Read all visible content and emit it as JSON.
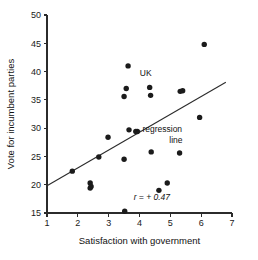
{
  "chart_data": {
    "type": "scatter",
    "title": "",
    "xlabel": "Satisfaction with government",
    "ylabel": "Vote for incumbent parties",
    "xlim": [
      1,
      7
    ],
    "ylim": [
      15,
      50
    ],
    "xticks": [
      1,
      2,
      3,
      4,
      5,
      6,
      7
    ],
    "yticks": [
      15,
      20,
      25,
      30,
      35,
      40,
      45,
      50
    ],
    "xtick_labels": [
      "1",
      "2",
      "3",
      "4",
      "5",
      "6",
      "7"
    ],
    "ytick_labels": [
      "15",
      "20",
      "25",
      "30",
      "35",
      "40",
      "45",
      "50"
    ],
    "grid": false,
    "legend": "none",
    "points": [
      {
        "x": 1.82,
        "y": 22.4
      },
      {
        "x": 2.4,
        "y": 20.3
      },
      {
        "x": 2.4,
        "y": 19.4
      },
      {
        "x": 2.43,
        "y": 19.7
      },
      {
        "x": 2.68,
        "y": 24.9
      },
      {
        "x": 2.98,
        "y": 28.4
      },
      {
        "x": 3.5,
        "y": 35.6
      },
      {
        "x": 3.5,
        "y": 24.5
      },
      {
        "x": 3.52,
        "y": 15.3
      },
      {
        "x": 3.57,
        "y": 37.0
      },
      {
        "x": 3.63,
        "y": 41.0
      },
      {
        "x": 3.66,
        "y": 29.7
      },
      {
        "x": 3.88,
        "y": 29.4
      },
      {
        "x": 3.93,
        "y": 29.4
      },
      {
        "x": 4.33,
        "y": 37.2
      },
      {
        "x": 4.36,
        "y": 35.8
      },
      {
        "x": 4.38,
        "y": 25.8
      },
      {
        "x": 4.63,
        "y": 19.0
      },
      {
        "x": 4.9,
        "y": 20.3
      },
      {
        "x": 5.3,
        "y": 25.6
      },
      {
        "x": 5.32,
        "y": 36.5
      },
      {
        "x": 5.4,
        "y": 36.6
      },
      {
        "x": 5.95,
        "y": 31.9
      },
      {
        "x": 6.1,
        "y": 44.8
      }
    ],
    "regression_line": {
      "x_start": 1.0,
      "y_start": 19.8,
      "x_end": 6.8,
      "y_end": 38.1
    },
    "annotations": [
      {
        "name": "uk-label",
        "text": "UK",
        "x": 4.2,
        "y": 39.3
      },
      {
        "name": "regression-label-line1",
        "text": "←regression",
        "x": 4.6,
        "y": 29.3
      },
      {
        "name": "regression-label-line2",
        "text": "line",
        "x": 5.18,
        "y": 27.3
      },
      {
        "name": "correlation-label",
        "text": "r = + 0.47",
        "x": 4.4,
        "y": 17.3
      }
    ],
    "colors": {
      "point": "#1b1b1b",
      "line": "#2b2b2b",
      "axis": "#2b2b2b",
      "background": "#ffffff"
    }
  }
}
